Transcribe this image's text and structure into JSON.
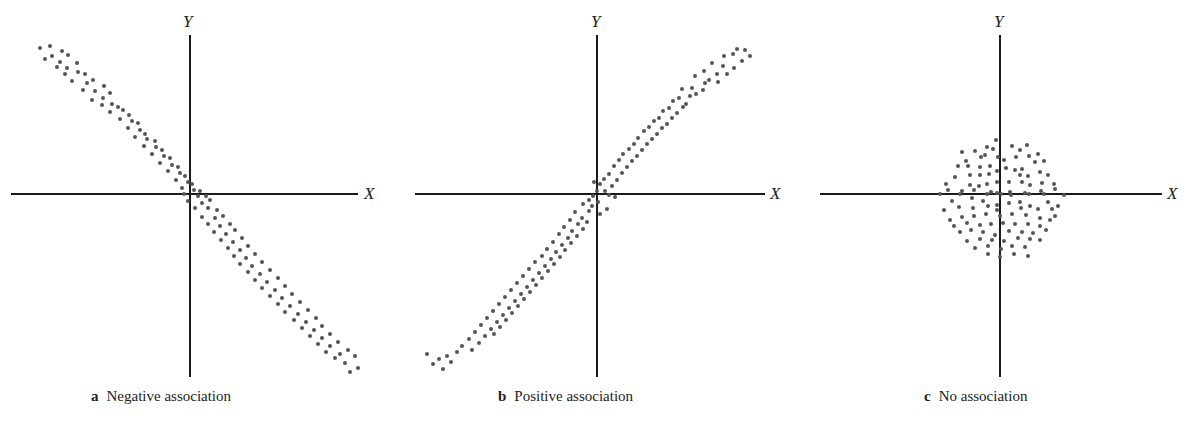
{
  "figure": {
    "panels": [
      {
        "id": "a",
        "letter": "a",
        "caption": "Negative association",
        "x_label": "X",
        "y_label": "Y"
      },
      {
        "id": "b",
        "letter": "b",
        "caption": "Positive association",
        "x_label": "X",
        "y_label": "Y"
      },
      {
        "id": "c",
        "letter": "c",
        "caption": "No association",
        "x_label": "X",
        "y_label": "Y"
      }
    ],
    "dot_color": "#555555",
    "axis_color": "#1a1a1a"
  },
  "chart_data": [
    {
      "type": "scatter",
      "title": "a Negative association",
      "xlabel": "X",
      "ylabel": "Y",
      "grid": false,
      "trend": "negative",
      "xlim": [
        -180,
        170
      ],
      "ylim": [
        -185,
        160
      ],
      "points": [
        [
          -150,
          146
        ],
        [
          -140,
          148
        ],
        [
          -128,
          143
        ],
        [
          -145,
          135
        ],
        [
          -138,
          138
        ],
        [
          -130,
          132
        ],
        [
          -122,
          139
        ],
        [
          -133,
          127
        ],
        [
          -123,
          126
        ],
        [
          -113,
          131
        ],
        [
          -125,
          120
        ],
        [
          -112,
          122
        ],
        [
          -105,
          120
        ],
        [
          -118,
          113
        ],
        [
          -103,
          111
        ],
        [
          -97,
          114
        ],
        [
          -107,
          104
        ],
        [
          -95,
          103
        ],
        [
          -86,
          108
        ],
        [
          -98,
          94
        ],
        [
          -87,
          96
        ],
        [
          -80,
          101
        ],
        [
          -88,
          89
        ],
        [
          -78,
          90
        ],
        [
          -72,
          87
        ],
        [
          -80,
          82
        ],
        [
          -67,
          84
        ],
        [
          -61,
          79
        ],
        [
          -70,
          75
        ],
        [
          -58,
          73
        ],
        [
          -52,
          71
        ],
        [
          -62,
          66
        ],
        [
          -50,
          64
        ],
        [
          -45,
          60
        ],
        [
          -55,
          57
        ],
        [
          -43,
          55
        ],
        [
          -35,
          53
        ],
        [
          -46,
          48
        ],
        [
          -34,
          47
        ],
        [
          -28,
          44
        ],
        [
          -38,
          40
        ],
        [
          -26,
          38
        ],
        [
          -20,
          36
        ],
        [
          -30,
          31
        ],
        [
          -18,
          29
        ],
        [
          -12,
          27
        ],
        [
          -22,
          23
        ],
        [
          -10,
          21
        ],
        [
          -5,
          18
        ],
        [
          -14,
          14
        ],
        [
          -2,
          12
        ],
        [
          2,
          10
        ],
        [
          -8,
          6
        ],
        [
          4,
          4
        ],
        [
          10,
          3
        ],
        [
          -6,
          0
        ],
        [
          8,
          -2
        ],
        [
          16,
          -2
        ],
        [
          -2,
          -7
        ],
        [
          12,
          -9
        ],
        [
          20,
          -6
        ],
        [
          5,
          -14
        ],
        [
          18,
          -14
        ],
        [
          27,
          -16
        ],
        [
          12,
          -23
        ],
        [
          25,
          -24
        ],
        [
          33,
          -22
        ],
        [
          18,
          -30
        ],
        [
          30,
          -32
        ],
        [
          40,
          -30
        ],
        [
          24,
          -38
        ],
        [
          36,
          -40
        ],
        [
          45,
          -36
        ],
        [
          31,
          -46
        ],
        [
          43,
          -48
        ],
        [
          52,
          -44
        ],
        [
          38,
          -54
        ],
        [
          50,
          -56
        ],
        [
          58,
          -52
        ],
        [
          44,
          -62
        ],
        [
          56,
          -64
        ],
        [
          65,
          -60
        ],
        [
          50,
          -70
        ],
        [
          62,
          -72
        ],
        [
          72,
          -68
        ],
        [
          58,
          -78
        ],
        [
          70,
          -80
        ],
        [
          80,
          -76
        ],
        [
          65,
          -86
        ],
        [
          77,
          -88
        ],
        [
          88,
          -84
        ],
        [
          72,
          -94
        ],
        [
          85,
          -96
        ],
        [
          95,
          -92
        ],
        [
          80,
          -102
        ],
        [
          92,
          -104
        ],
        [
          102,
          -100
        ],
        [
          88,
          -110
        ],
        [
          100,
          -112
        ],
        [
          110,
          -108
        ],
        [
          95,
          -118
        ],
        [
          108,
          -120
        ],
        [
          118,
          -116
        ],
        [
          104,
          -126
        ],
        [
          116,
          -128
        ],
        [
          126,
          -124
        ],
        [
          112,
          -134
        ],
        [
          124,
          -136
        ],
        [
          132,
          -132
        ],
        [
          120,
          -142
        ],
        [
          132,
          -144
        ],
        [
          140,
          -140
        ],
        [
          128,
          -150
        ],
        [
          140,
          -152
        ],
        [
          148,
          -148
        ],
        [
          136,
          -158
        ],
        [
          150,
          -160
        ],
        [
          158,
          -156
        ],
        [
          145,
          -164
        ],
        [
          165,
          -162
        ],
        [
          155,
          -169
        ],
        [
          168,
          -174
        ],
        [
          160,
          -178
        ]
      ]
    },
    {
      "type": "scatter",
      "title": "b Positive association",
      "xlabel": "X",
      "ylabel": "Y",
      "grid": false,
      "trend": "positive",
      "xlim": [
        -180,
        170
      ],
      "ylim": [
        -185,
        160
      ],
      "points": [
        [
          140,
          145
        ],
        [
          148,
          144
        ],
        [
          153,
          138
        ],
        [
          127,
          138
        ],
        [
          136,
          140
        ],
        [
          145,
          133
        ],
        [
          115,
          131
        ],
        [
          126,
          128
        ],
        [
          137,
          126
        ],
        [
          130,
          120
        ],
        [
          107,
          123
        ],
        [
          120,
          120
        ],
        [
          112,
          114
        ],
        [
          98,
          118
        ],
        [
          108,
          111
        ],
        [
          121,
          112
        ],
        [
          95,
          106
        ],
        [
          106,
          104
        ],
        [
          99,
          100
        ],
        [
          85,
          105
        ],
        [
          93,
          98
        ],
        [
          82,
          96
        ],
        [
          89,
          90
        ],
        [
          76,
          93
        ],
        [
          86,
          87
        ],
        [
          72,
          86
        ],
        [
          80,
          81
        ],
        [
          66,
          83
        ],
        [
          75,
          76
        ],
        [
          62,
          76
        ],
        [
          70,
          70
        ],
        [
          57,
          73
        ],
        [
          65,
          66
        ],
        [
          52,
          67
        ],
        [
          60,
          60
        ],
        [
          47,
          63
        ],
        [
          55,
          55
        ],
        [
          41,
          56
        ],
        [
          50,
          50
        ],
        [
          37,
          50
        ],
        [
          45,
          44
        ],
        [
          32,
          45
        ],
        [
          40,
          38
        ],
        [
          26,
          40
        ],
        [
          35,
          33
        ],
        [
          22,
          34
        ],
        [
          30,
          27
        ],
        [
          17,
          28
        ],
        [
          25,
          21
        ],
        [
          12,
          20
        ],
        [
          20,
          14
        ],
        [
          7,
          15
        ],
        [
          15,
          8
        ],
        [
          3,
          10
        ],
        [
          8,
          3
        ],
        [
          -3,
          12
        ],
        [
          0,
          3
        ],
        [
          12,
          -1
        ],
        [
          18,
          -3
        ],
        [
          -4,
          -2
        ],
        [
          -8,
          -6
        ],
        [
          -5,
          -12
        ],
        [
          1,
          -8
        ],
        [
          10,
          -15
        ],
        [
          -14,
          -10
        ],
        [
          -8,
          -17
        ],
        [
          -22,
          -18
        ],
        [
          -15,
          -24
        ],
        [
          3,
          -20
        ],
        [
          -27,
          -26
        ],
        [
          -19,
          -30
        ],
        [
          -10,
          -28
        ],
        [
          -33,
          -33
        ],
        [
          -25,
          -37
        ],
        [
          -14,
          -35
        ],
        [
          -38,
          -40
        ],
        [
          -29,
          -44
        ],
        [
          -20,
          -42
        ],
        [
          -44,
          -48
        ],
        [
          -35,
          -51
        ],
        [
          -26,
          -49
        ],
        [
          -50,
          -55
        ],
        [
          -41,
          -58
        ],
        [
          -32,
          -56
        ],
        [
          -55,
          -62
        ],
        [
          -46,
          -65
        ],
        [
          -37,
          -63
        ],
        [
          -62,
          -68
        ],
        [
          -52,
          -72
        ],
        [
          -43,
          -70
        ],
        [
          -68,
          -75
        ],
        [
          -58,
          -79
        ],
        [
          -49,
          -77
        ],
        [
          -74,
          -82
        ],
        [
          -64,
          -86
        ],
        [
          -55,
          -84
        ],
        [
          -80,
          -89
        ],
        [
          -70,
          -93
        ],
        [
          -61,
          -91
        ],
        [
          -86,
          -96
        ],
        [
          -76,
          -100
        ],
        [
          -67,
          -98
        ],
        [
          -92,
          -103
        ],
        [
          -82,
          -107
        ],
        [
          -73,
          -105
        ],
        [
          -98,
          -110
        ],
        [
          -88,
          -114
        ],
        [
          -79,
          -112
        ],
        [
          -104,
          -117
        ],
        [
          -94,
          -121
        ],
        [
          -85,
          -119
        ],
        [
          -110,
          -124
        ],
        [
          -100,
          -128
        ],
        [
          -91,
          -126
        ],
        [
          -116,
          -131
        ],
        [
          -106,
          -135
        ],
        [
          -97,
          -133
        ],
        [
          -122,
          -138
        ],
        [
          -112,
          -142
        ],
        [
          -103,
          -140
        ],
        [
          -128,
          -145
        ],
        [
          -118,
          -149
        ],
        [
          -135,
          -152
        ],
        [
          -125,
          -156
        ],
        [
          -140,
          -158
        ],
        [
          -150,
          -162
        ],
        [
          -146,
          -168
        ],
        [
          -158,
          -165
        ],
        [
          -164,
          -170
        ],
        [
          -154,
          -175
        ],
        [
          -170,
          -160
        ]
      ]
    },
    {
      "type": "scatter",
      "title": "c No association",
      "xlabel": "X",
      "ylabel": "Y",
      "grid": false,
      "trend": "none",
      "xlim": [
        -180,
        165
      ],
      "ylim": [
        -185,
        160
      ],
      "points": [
        [
          -4,
          54
        ],
        [
          -38,
          42
        ],
        [
          -25,
          43
        ],
        [
          -13,
          47
        ],
        [
          -7,
          45
        ],
        [
          12,
          48
        ],
        [
          20,
          44
        ],
        [
          27,
          49
        ],
        [
          -34,
          33
        ],
        [
          -19,
          37
        ],
        [
          -15,
          39
        ],
        [
          -2,
          37
        ],
        [
          4,
          34
        ],
        [
          16,
          37
        ],
        [
          29,
          38
        ],
        [
          38,
          40
        ],
        [
          -42,
          28
        ],
        [
          -32,
          28
        ],
        [
          -20,
          27
        ],
        [
          -10,
          28
        ],
        [
          6,
          26
        ],
        [
          15,
          24
        ],
        [
          22,
          25
        ],
        [
          35,
          32
        ],
        [
          44,
          33
        ],
        [
          -45,
          17
        ],
        [
          -30,
          19
        ],
        [
          -20,
          19
        ],
        [
          -11,
          20
        ],
        [
          -3,
          23
        ],
        [
          20,
          19
        ],
        [
          28,
          18
        ],
        [
          40,
          22
        ],
        [
          48,
          19
        ],
        [
          -54,
          10
        ],
        [
          -30,
          9
        ],
        [
          -21,
          8
        ],
        [
          -13,
          10
        ],
        [
          -3,
          12
        ],
        [
          9,
          12
        ],
        [
          22,
          12
        ],
        [
          30,
          9
        ],
        [
          42,
          11
        ],
        [
          54,
          10
        ],
        [
          -52,
          4
        ],
        [
          -38,
          3
        ],
        [
          -26,
          4
        ],
        [
          -9,
          2
        ],
        [
          -3,
          1
        ],
        [
          10,
          2
        ],
        [
          25,
          1
        ],
        [
          41,
          3
        ],
        [
          55,
          5
        ],
        [
          -60,
          0
        ],
        [
          -40,
          0
        ],
        [
          -13,
          0
        ],
        [
          1,
          0
        ],
        [
          11,
          -1
        ],
        [
          29,
          0
        ],
        [
          44,
          0
        ],
        [
          64,
          -1
        ],
        [
          -48,
          -7
        ],
        [
          -28,
          -4
        ],
        [
          -17,
          -7
        ],
        [
          -3,
          -11
        ],
        [
          9,
          -9
        ],
        [
          20,
          -8
        ],
        [
          30,
          -12
        ],
        [
          48,
          -8
        ],
        [
          58,
          -12
        ],
        [
          -56,
          -16
        ],
        [
          -41,
          -13
        ],
        [
          -27,
          -14
        ],
        [
          -12,
          -12
        ],
        [
          -3,
          -16
        ],
        [
          21,
          -14
        ],
        [
          38,
          -15
        ],
        [
          52,
          -15
        ],
        [
          -50,
          -26
        ],
        [
          -38,
          -23
        ],
        [
          -26,
          -22
        ],
        [
          -14,
          -20
        ],
        [
          0,
          -22
        ],
        [
          12,
          -20
        ],
        [
          26,
          -21
        ],
        [
          40,
          -24
        ],
        [
          55,
          -22
        ],
        [
          -46,
          -32
        ],
        [
          -33,
          -29
        ],
        [
          -20,
          -31
        ],
        [
          -9,
          -30
        ],
        [
          3,
          -29
        ],
        [
          15,
          -30
        ],
        [
          28,
          -30
        ],
        [
          40,
          -32
        ],
        [
          50,
          -26
        ],
        [
          -40,
          -38
        ],
        [
          -29,
          -36
        ],
        [
          -17,
          -38
        ],
        [
          -5,
          -41
        ],
        [
          9,
          -37
        ],
        [
          22,
          -38
        ],
        [
          33,
          -39
        ],
        [
          46,
          -36
        ],
        [
          -33,
          -47
        ],
        [
          -20,
          -45
        ],
        [
          -8,
          -46
        ],
        [
          4,
          -47
        ],
        [
          18,
          -44
        ],
        [
          30,
          -45
        ],
        [
          40,
          -46
        ],
        [
          -25,
          -54
        ],
        [
          -12,
          -52
        ],
        [
          1,
          -55
        ],
        [
          12,
          -52
        ],
        [
          25,
          -53
        ],
        [
          -12,
          -60
        ],
        [
          0,
          -63
        ],
        [
          14,
          -60
        ],
        [
          28,
          -62
        ]
      ]
    }
  ]
}
